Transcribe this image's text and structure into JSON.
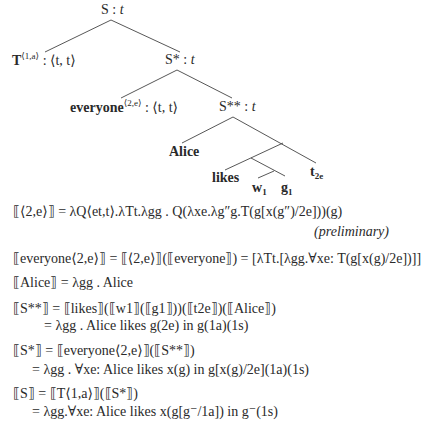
{
  "tree": {
    "root": {
      "label": "S",
      "type": "t"
    },
    "T_node": {
      "label": "T",
      "sup": "⟨1,a⟩",
      "type": "⟨t, t⟩"
    },
    "s_star": {
      "label": "S*",
      "type": "t"
    },
    "everyone_node": {
      "label": "everyone",
      "sup": "⟨2,e⟩",
      "type": "⟨t, t⟩"
    },
    "s_starstar": {
      "label": "S**",
      "type": "t"
    },
    "alice": "Alice",
    "likes": "likes",
    "w1": {
      "label": "w",
      "sub": "1"
    },
    "g1": {
      "label": "g",
      "sub": "1"
    },
    "t2e": {
      "label": "t",
      "sub": "2e"
    }
  },
  "formulas": {
    "f1_lhs": "⟦⟨2,e⟩⟧",
    "f1_rhs": "= λQ⟨et,t⟩.λTt.λgg . Q(λxe.λg″g.T(g[x(g″)/2e]))(g)",
    "f1_note": "(preliminary)",
    "f2": "⟦everyone⟨2,e⟩⟧ = ⟦⟨2,e⟩⟧(⟦everyone⟧) = [λTt.[λgg.∀xe: T(g[x(g)/2e])]]",
    "f3": "⟦Alice⟧ = λgg . Alice",
    "f4a": "⟦S**⟧ = ⟦likes⟧(⟦w1⟧(⟦g1⟧))(⟦t2e⟧)(⟦Alice⟧)",
    "f4b": "= λgg . Alice likes g(2e) in g(1a)(1s)",
    "f5a": "⟦S*⟧ = ⟦everyone⟨2,e⟩⟧(⟦S**⟧)",
    "f5b": "= λgg . ∀xe: Alice likes x(g) in g[x(g)/2e](1a)(1s)",
    "f6a": "⟦S⟧ = ⟦T⟨1,a⟩⟧(⟦S*⟧)",
    "f6b": "= λgg.∀xe: Alice likes x(g[g⁻/1a]) in g⁻(1s)"
  }
}
